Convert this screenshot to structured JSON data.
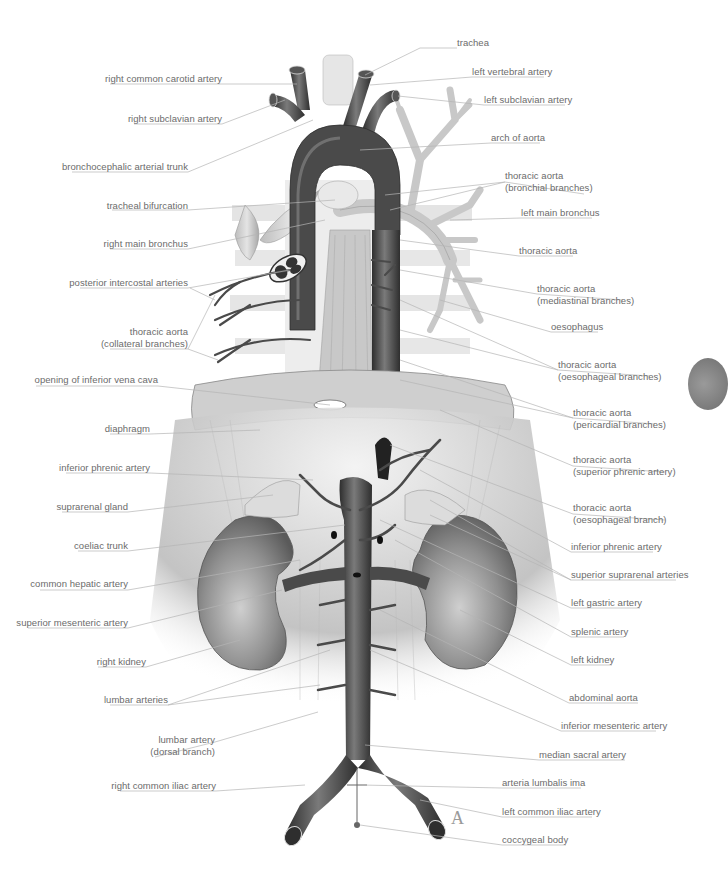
{
  "figure": {
    "letter": "A"
  },
  "labels_left": [
    {
      "id": "right-common-carotid-artery",
      "text": [
        "right common carotid artery"
      ],
      "x": 222,
      "y": 73
    },
    {
      "id": "right-subclavian-artery",
      "text": [
        "right subclavian artery"
      ],
      "x": 222,
      "y": 113
    },
    {
      "id": "bronchocephalic-arterial-trunk",
      "text": [
        "bronchocephalic arterial trunk"
      ],
      "x": 188,
      "y": 161
    },
    {
      "id": "tracheal-bifurcation",
      "text": [
        "tracheal bifurcation"
      ],
      "x": 188,
      "y": 200
    },
    {
      "id": "right-main-bronchus",
      "text": [
        "right main bronchus"
      ],
      "x": 188,
      "y": 238
    },
    {
      "id": "posterior-intercostal-arteries",
      "text": [
        "posterior intercostal arteries"
      ],
      "x": 188,
      "y": 277
    },
    {
      "id": "thoracic-aorta-collateral",
      "text": [
        "thoracic aorta",
        "(collateral branches)"
      ],
      "x": 188,
      "y": 326
    },
    {
      "id": "opening-inferior-vena-cava",
      "text": [
        "opening of inferior vena cava"
      ],
      "x": 158,
      "y": 374
    },
    {
      "id": "diaphragm",
      "text": [
        "diaphragm"
      ],
      "x": 150,
      "y": 423
    },
    {
      "id": "inferior-phrenic-artery-r",
      "text": [
        "inferior phrenic artery"
      ],
      "x": 150,
      "y": 462
    },
    {
      "id": "suprarenal-gland",
      "text": [
        "suprarenal gland"
      ],
      "x": 128,
      "y": 501
    },
    {
      "id": "coeliac-trunk",
      "text": [
        "coeliac trunk"
      ],
      "x": 128,
      "y": 540
    },
    {
      "id": "common-hepatic-artery",
      "text": [
        "common hepatic artery"
      ],
      "x": 128,
      "y": 578
    },
    {
      "id": "superior-mesenteric-artery",
      "text": [
        "superior mesenteric artery"
      ],
      "x": 128,
      "y": 617
    },
    {
      "id": "right-kidney",
      "text": [
        "right kidney"
      ],
      "x": 146,
      "y": 656
    },
    {
      "id": "lumbar-arteries",
      "text": [
        "lumbar arteries"
      ],
      "x": 168,
      "y": 694
    },
    {
      "id": "lumbar-artery-dorsal",
      "text": [
        "lumbar artery",
        "(dorsal branch)"
      ],
      "x": 215,
      "y": 734
    },
    {
      "id": "right-common-iliac-artery",
      "text": [
        "right common iliac artery"
      ],
      "x": 216,
      "y": 780
    }
  ],
  "labels_right": [
    {
      "id": "trachea",
      "text": [
        "trachea"
      ],
      "x": 457,
      "y": 37
    },
    {
      "id": "left-vertebral-artery",
      "text": [
        "left vertebral artery"
      ],
      "x": 472,
      "y": 66
    },
    {
      "id": "left-subclavian-artery",
      "text": [
        "left subclavian artery"
      ],
      "x": 484,
      "y": 94
    },
    {
      "id": "arch-of-aorta",
      "text": [
        "arch of aorta"
      ],
      "x": 491,
      "y": 132
    },
    {
      "id": "thoracic-aorta-bronchial",
      "text": [
        "thoracic aorta",
        "(bronchial branches)"
      ],
      "x": 505,
      "y": 170
    },
    {
      "id": "left-main-bronchus",
      "text": [
        "left main bronchus"
      ],
      "x": 521,
      "y": 207
    },
    {
      "id": "thoracic-aorta",
      "text": [
        "thoracic aorta"
      ],
      "x": 519,
      "y": 245
    },
    {
      "id": "thoracic-aorta-mediastinal",
      "text": [
        "thoracic aorta",
        "(mediastinal branches)"
      ],
      "x": 537,
      "y": 283
    },
    {
      "id": "oesophagus",
      "text": [
        "oesophagus"
      ],
      "x": 551,
      "y": 321
    },
    {
      "id": "thoracic-aorta-oesophageal",
      "text": [
        "thoracic aorta",
        "(oesophageal branches)"
      ],
      "x": 558,
      "y": 359
    },
    {
      "id": "thoracic-aorta-pericardial",
      "text": [
        "thoracic aorta",
        "(pericardial branches)"
      ],
      "x": 573,
      "y": 407
    },
    {
      "id": "thoracic-aorta-superior-phrenic",
      "text": [
        "thoracic aorta",
        "(superior phrenic artery)"
      ],
      "x": 573,
      "y": 454
    },
    {
      "id": "thoracic-aorta-oesophageal-branch",
      "text": [
        "thoracic aorta",
        "(oesophageal branch)"
      ],
      "x": 573,
      "y": 502
    },
    {
      "id": "inferior-phrenic-artery-l",
      "text": [
        "inferior phrenic artery"
      ],
      "x": 571,
      "y": 541
    },
    {
      "id": "superior-suprarenal-arteries",
      "text": [
        "superior suprarenal arteries"
      ],
      "x": 571,
      "y": 569
    },
    {
      "id": "left-gastric-artery",
      "text": [
        "left gastric artery"
      ],
      "x": 571,
      "y": 597
    },
    {
      "id": "splenic-artery",
      "text": [
        "splenic artery"
      ],
      "x": 571,
      "y": 626
    },
    {
      "id": "left-kidney",
      "text": [
        "left kidney"
      ],
      "x": 571,
      "y": 654
    },
    {
      "id": "abdominal-aorta",
      "text": [
        "abdominal aorta"
      ],
      "x": 569,
      "y": 692
    },
    {
      "id": "inferior-mesenteric-artery",
      "text": [
        "inferior mesenteric artery"
      ],
      "x": 561,
      "y": 720
    },
    {
      "id": "median-sacral-artery",
      "text": [
        "median sacral artery"
      ],
      "x": 539,
      "y": 749
    },
    {
      "id": "arteria-lumbalis-ima",
      "text": [
        "arteria lumbalis ima"
      ],
      "x": 502,
      "y": 777
    },
    {
      "id": "left-common-iliac-artery",
      "text": [
        "left common iliac artery"
      ],
      "x": 502,
      "y": 806
    },
    {
      "id": "coccygeal-body",
      "text": [
        "coccygeal body"
      ],
      "x": 502,
      "y": 834
    }
  ],
  "colors": {
    "label_text": "#6b6b6b",
    "leader_line": "#b5b5b5",
    "vessel_dark": "#3c3c3c",
    "vessel_mid": "#6a6a6a",
    "tissue_light": "#d8d8d8",
    "background": "#ffffff"
  }
}
